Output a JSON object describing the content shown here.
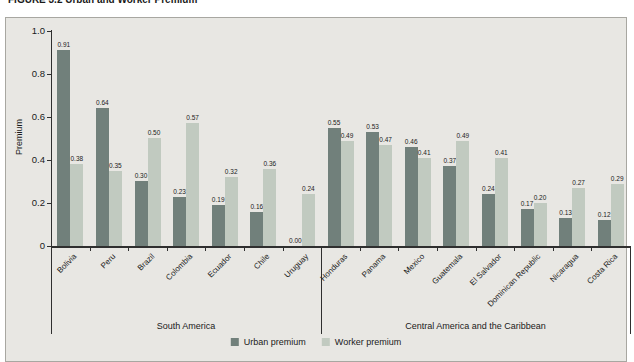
{
  "figure": {
    "title_fragment": "FIGURE 3.2   Urban and Worker Premium"
  },
  "chart_data": {
    "type": "bar",
    "title": "FIGURE 3.2   Urban and Worker Premium",
    "ylabel": "Premium",
    "ylim": [
      0,
      1.0
    ],
    "yticks": [
      0,
      0.2,
      0.4,
      0.6,
      0.8,
      1.0
    ],
    "ytick_labels": [
      "0",
      "0.2",
      "0.4",
      "0.6",
      "0.8",
      "1.0"
    ],
    "grid": false,
    "legend_position": "bottom",
    "value_labels": true,
    "categories": [
      "Bolivia",
      "Peru",
      "Brazil",
      "Colombia",
      "Ecuador",
      "Chile",
      "Uruguay",
      "Honduras",
      "Panama",
      "Mexico",
      "Guatemala",
      "El Salvador",
      "Dominican Republic",
      "Nicaragua",
      "Costa Rica"
    ],
    "series": [
      {
        "name": "Urban premium",
        "color": "#71807b",
        "values": [
          0.91,
          0.64,
          0.3,
          0.23,
          0.19,
          0.16,
          0.0,
          0.55,
          0.53,
          0.46,
          0.37,
          0.24,
          0.17,
          0.13,
          0.12
        ]
      },
      {
        "name": "Worker premium",
        "color": "#c1cac0",
        "values": [
          0.38,
          0.35,
          0.5,
          0.57,
          0.32,
          0.36,
          0.24,
          0.49,
          0.47,
          0.41,
          0.49,
          0.41,
          0.2,
          0.27,
          0.29
        ]
      }
    ],
    "groups": [
      {
        "label": "South America",
        "count": 7
      },
      {
        "label": "Central America and the Caribbean",
        "count": 8
      }
    ],
    "colors": {
      "panel_background": "#e8e7e3",
      "page_background": "#ffffff",
      "axis": "#2f2f2f",
      "text": "#1a1a1a"
    }
  }
}
